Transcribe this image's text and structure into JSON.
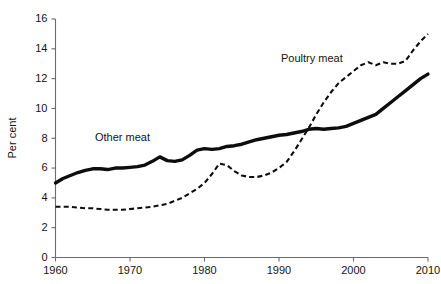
{
  "chart_data": {
    "type": "line",
    "title": "",
    "xlabel": "",
    "ylabel": "Per cent",
    "xlim": [
      1960,
      2010
    ],
    "ylim": [
      0,
      16
    ],
    "ytick_values": [
      0,
      2,
      4,
      6,
      8,
      10,
      12,
      14,
      16
    ],
    "ytick_labels": [
      "0",
      "2",
      "4",
      "6",
      "8",
      "10",
      "12",
      "14",
      "16"
    ],
    "xtick_values": [
      1960,
      1970,
      1980,
      1990,
      2000,
      2010
    ],
    "xtick_labels": [
      "1960",
      "1970",
      "1980",
      "1990",
      "2000",
      "2010"
    ],
    "grid": false,
    "legend_position": "inline-annotations",
    "x": [
      1960,
      1961,
      1962,
      1963,
      1964,
      1965,
      1966,
      1967,
      1968,
      1969,
      1970,
      1971,
      1972,
      1973,
      1974,
      1975,
      1976,
      1977,
      1978,
      1979,
      1980,
      1981,
      1982,
      1983,
      1984,
      1985,
      1986,
      1987,
      1988,
      1989,
      1990,
      1991,
      1992,
      1993,
      1994,
      1995,
      1996,
      1997,
      1998,
      1999,
      2000,
      2001,
      2002,
      2003,
      2004,
      2005,
      2006,
      2007,
      2008,
      2009,
      2010
    ],
    "series": [
      {
        "name": "Other meat",
        "style": "solid",
        "color": "#0d0d0d",
        "label_text": "Other meat",
        "values": [
          5.0,
          5.3,
          5.5,
          5.7,
          5.85,
          5.95,
          5.95,
          5.9,
          6.0,
          6.0,
          6.05,
          6.1,
          6.2,
          6.45,
          6.75,
          6.5,
          6.45,
          6.55,
          6.85,
          7.2,
          7.3,
          7.25,
          7.3,
          7.45,
          7.5,
          7.6,
          7.75,
          7.9,
          8.0,
          8.1,
          8.2,
          8.25,
          8.35,
          8.45,
          8.6,
          8.65,
          8.6,
          8.65,
          8.7,
          8.8,
          9.0,
          9.2,
          9.4,
          9.6,
          10.0,
          10.4,
          10.8,
          11.2,
          11.6,
          12.0,
          12.3
        ]
      },
      {
        "name": "Poultry meat",
        "style": "dashed",
        "color": "#0d0d0d",
        "label_text": "Poultry meat",
        "values": [
          3.4,
          3.4,
          3.4,
          3.35,
          3.3,
          3.3,
          3.25,
          3.2,
          3.2,
          3.2,
          3.25,
          3.3,
          3.35,
          3.4,
          3.5,
          3.6,
          3.8,
          4.0,
          4.3,
          4.6,
          5.0,
          5.6,
          6.3,
          6.2,
          5.8,
          5.5,
          5.4,
          5.4,
          5.5,
          5.7,
          6.0,
          6.4,
          7.1,
          7.9,
          8.7,
          9.6,
          10.4,
          11.1,
          11.7,
          12.1,
          12.5,
          12.9,
          13.1,
          12.9,
          13.1,
          13.0,
          13.0,
          13.2,
          13.9,
          14.5,
          15.0
        ]
      }
    ]
  },
  "annotations": [
    {
      "text": "Other meat",
      "x": 95,
      "y": 141
    },
    {
      "text": "Poultry meat",
      "x": 281,
      "y": 62
    }
  ]
}
